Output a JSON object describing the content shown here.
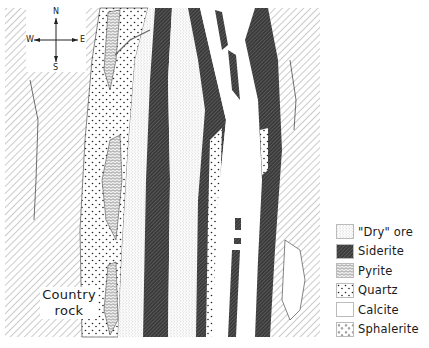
{
  "figure": {
    "title": "",
    "compass": {
      "north": "N",
      "south": "S",
      "east": "E",
      "west": "W"
    },
    "labels": {
      "country_rock_line1": "Country",
      "country_rock_line2": "rock"
    },
    "colors": {
      "ink": "#1a1a1a",
      "background": "#ffffff",
      "hatch_light": "#777777",
      "siderite_dark": "#2b2b2b"
    }
  },
  "legend": {
    "items": [
      {
        "label": "\"Dry\" ore",
        "pattern": "fine-stipple"
      },
      {
        "label": "Siderite",
        "pattern": "dense-dark-hatch"
      },
      {
        "label": "Pyrite",
        "pattern": "crosshatch-scale"
      },
      {
        "label": "Quartz",
        "pattern": "coarse-dots"
      },
      {
        "label": "Calcite",
        "pattern": "blank"
      },
      {
        "label": "Sphalerite",
        "pattern": "triangles"
      }
    ]
  }
}
